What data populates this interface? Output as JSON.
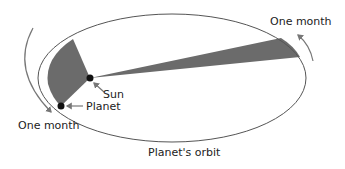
{
  "diagram": {
    "labels": {
      "sun": "Sun",
      "planet": "Planet",
      "orbit": "Planet's orbit",
      "month_left": "One month",
      "month_right": "One month"
    },
    "colors": {
      "orbit": "#555555",
      "wedge": "#6b6b6b",
      "body": "#111111",
      "arrow": "#777777",
      "text": "#222222"
    }
  }
}
